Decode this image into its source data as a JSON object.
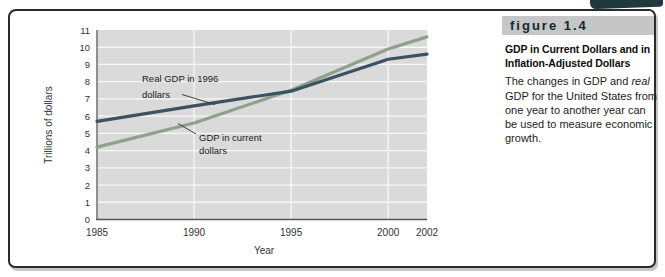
{
  "figure_label": "figure 1.4",
  "sidebar": {
    "title_line1": "GDP in Current Dollars and in",
    "title_line2": "Inflation-Adjusted Dollars",
    "body_pre": "The changes in GDP and ",
    "body_italic": "real",
    "body_post": " GDP for the United States from one year to another year can be used to measure economic growth."
  },
  "chart_data": {
    "type": "line",
    "title": "",
    "xlabel": "Year",
    "ylabel": "Trillions of dollars",
    "x": [
      1985,
      1990,
      1995,
      2000,
      2002
    ],
    "x_tick_labels": [
      "1985",
      "1990",
      "1995",
      "2000",
      "2002"
    ],
    "y_ticks": [
      0,
      1,
      2,
      3,
      4,
      5,
      6,
      7,
      8,
      9,
      10,
      11
    ],
    "xlim": [
      1985,
      2002
    ],
    "ylim": [
      0,
      11
    ],
    "grid": true,
    "vertical_gridlines_at": [
      1990,
      1995,
      2000
    ],
    "plot_bg": "#dadada",
    "legend_position": "inline-annotations",
    "series": [
      {
        "name": "Real GDP in 1996 dollars",
        "color": "#3c5260",
        "values": [
          5.7,
          6.6,
          7.45,
          9.3,
          9.6
        ]
      },
      {
        "name": "GDP in current dollars",
        "color": "#8fa18c",
        "values": [
          4.2,
          5.6,
          7.5,
          9.9,
          10.6
        ]
      }
    ],
    "annotations": [
      {
        "line1": "Real GDP in 1996",
        "line2": "dollars"
      },
      {
        "line1": "GDP in current",
        "line2": "dollars"
      }
    ]
  },
  "colors": {
    "figure_border": "#2a2a2a",
    "corner_tab": "#20393d",
    "label_bar": "#c6c6c6",
    "plot_bg": "#dadada",
    "grid": "#f7f7f7",
    "axis": "#666666",
    "tick_text": "#333333",
    "annotation_text": "#1b1b1b",
    "real_line": "#3c5260",
    "current_line": "#8fa18c"
  }
}
